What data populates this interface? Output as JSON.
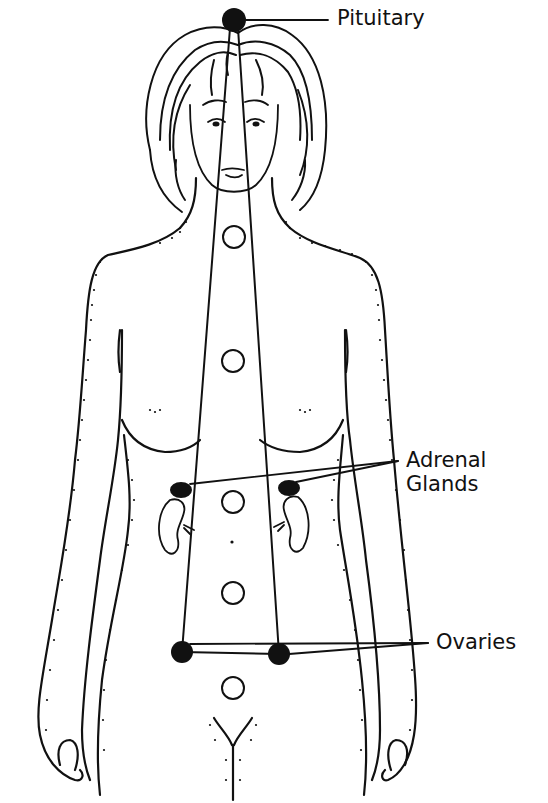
{
  "figure": {
    "background": "#ffffff",
    "ink_color": "#111111"
  },
  "labels": {
    "pituitary": "Pituitary",
    "adrenal_line1": "Adrenal",
    "adrenal_line2": "Glands",
    "ovaries": "Ovaries"
  },
  "markers": {
    "pituitary": {
      "x": 234,
      "y": 20,
      "r": 12,
      "filled": true
    },
    "adrenal_left": {
      "x": 180,
      "y": 491
    },
    "adrenal_right": {
      "x": 289,
      "y": 489
    },
    "ovary_left": {
      "x": 182,
      "y": 652,
      "r": 11,
      "filled": true
    },
    "ovary_right": {
      "x": 279,
      "y": 654,
      "r": 11,
      "filled": true
    },
    "chakra_circles": [
      {
        "x": 234,
        "y": 237,
        "r": 11
      },
      {
        "x": 233,
        "y": 361,
        "r": 11
      },
      {
        "x": 233,
        "y": 502,
        "r": 11
      },
      {
        "x": 233,
        "y": 593,
        "r": 11
      },
      {
        "x": 233,
        "y": 688,
        "r": 11
      }
    ]
  }
}
